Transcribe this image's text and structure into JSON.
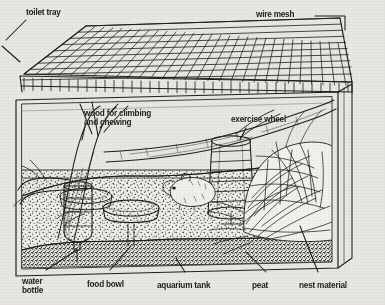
{
  "diagram": {
    "background_color": "#e9e7e1",
    "ink_color": "#1d1d1d",
    "labels": {
      "toilet_tray": "toilet tray",
      "wire_mesh": "wire mesh",
      "wood": "wood for climbing\nand chewing",
      "wood_line1": "wood for climbing",
      "wood_line2": "and chewing",
      "exercise_wheel": "exercise wheel",
      "water_bottle_line1": "water",
      "water_bottle_line2": "bottle",
      "food_bowl": "food bowl",
      "aquarium_tank": "aquarium tank",
      "peat": "peat",
      "nest_material": "nest material"
    },
    "parts": [
      "wire mesh lid",
      "toilet tray",
      "wood for climbing and chewing",
      "exercise wheel",
      "water bottle",
      "food bowl",
      "aquarium tank",
      "peat",
      "nest material",
      "hamster"
    ]
  }
}
